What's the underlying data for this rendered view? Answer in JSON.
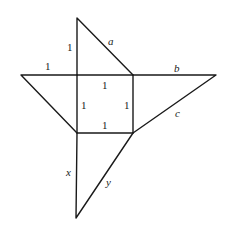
{
  "diagram": {
    "type": "geometry-figure",
    "square": {
      "side_labels": [
        "1",
        "1",
        "1",
        "1"
      ]
    },
    "labels": {
      "top_leg": "1",
      "left_leg": "1",
      "square_top": "1",
      "square_left": "1",
      "square_right": "1",
      "square_bottom": "1",
      "a": "a",
      "b": "b",
      "c": "c",
      "x": "x",
      "y": "y"
    }
  }
}
